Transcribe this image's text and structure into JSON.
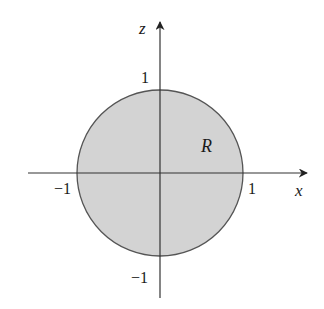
{
  "figure": {
    "type": "region-diagram",
    "region": {
      "label": "R",
      "shape": "disk",
      "center": [
        0,
        0
      ],
      "radius": 1,
      "fill_color": "#d3d3d3",
      "stroke_color": "#555555"
    },
    "axes": {
      "horizontal": {
        "label": "x",
        "ticks": [
          {
            "value": -1,
            "label": "−1"
          },
          {
            "value": 1,
            "label": "1"
          }
        ]
      },
      "vertical": {
        "label": "z",
        "ticks": [
          {
            "value": 1,
            "label": "1"
          },
          {
            "value": -1,
            "label": "−1"
          }
        ]
      },
      "color": "#333333"
    }
  }
}
